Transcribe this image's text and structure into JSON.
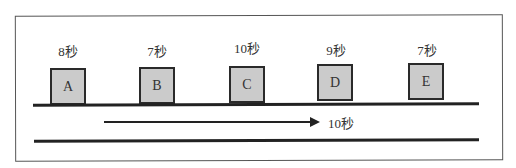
{
  "diagram": {
    "items": [
      {
        "id": "A",
        "time": "8秒"
      },
      {
        "id": "B",
        "time": "7秒"
      },
      {
        "id": "C",
        "time": "10秒"
      },
      {
        "id": "D",
        "time": "9秒"
      },
      {
        "id": "E",
        "time": "7秒"
      }
    ],
    "arrow_label": "10秒"
  }
}
